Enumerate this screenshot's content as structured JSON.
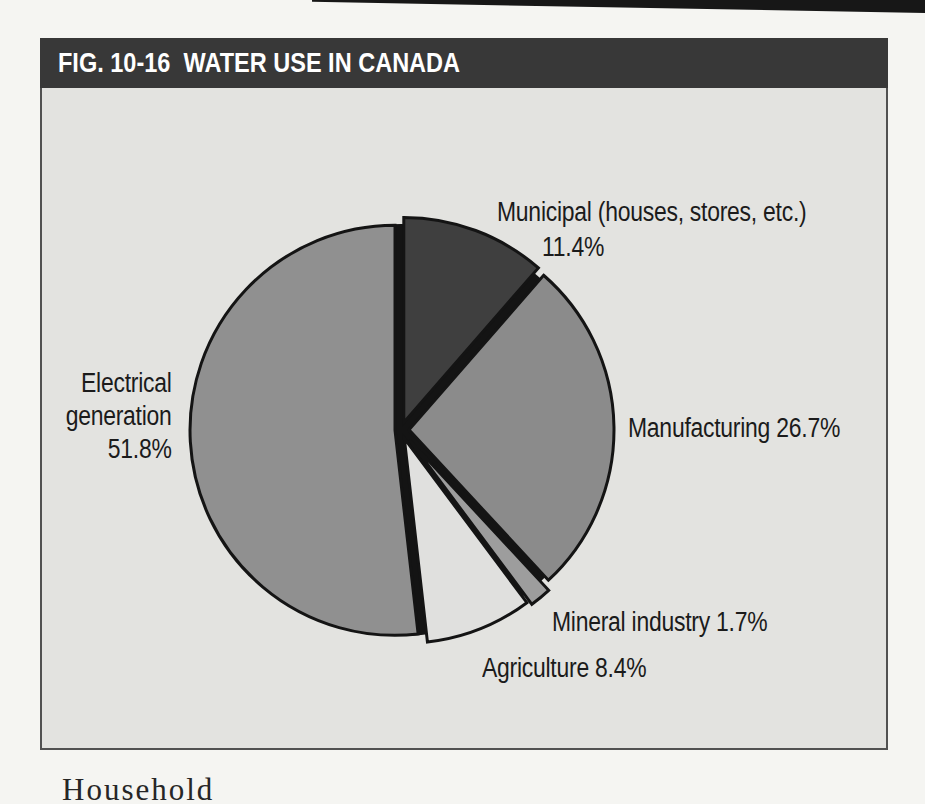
{
  "figure": {
    "title": "FIG. 10-16  WATER USE IN CANADA"
  },
  "chart_data": {
    "type": "pie",
    "title": "FIG. 10-16 WATER USE IN CANADA",
    "unit": "percent",
    "start_angle_deg_cw_from_top": 0,
    "direction": "clockwise",
    "gap_color": "#141414",
    "outline_color": "#141414",
    "slices": [
      {
        "label": "Municipal (houses, stores, etc.)",
        "value": 11.4,
        "color": "#3f3f3f",
        "explode_px": 8
      },
      {
        "label": "Manufacturing",
        "value": 26.7,
        "color": "#8b8b8b",
        "explode_px": 8
      },
      {
        "label": "Mineral industry",
        "value": 1.7,
        "color": "#9d9d9d",
        "explode_px": 13
      },
      {
        "label": "Agriculture",
        "value": 8.4,
        "color": "#e0e0de",
        "explode_px": 9
      },
      {
        "label": "Electrical generation",
        "value": 51.8,
        "color": "#909090",
        "explode_px": 6
      }
    ],
    "labels": {
      "municipal_line1": "Municipal (houses, stores, etc.)",
      "municipal_line2": "11.4%",
      "manufacturing": "Manufacturing 26.7%",
      "mineral": "Mineral industry 1.7%",
      "agriculture": "Agriculture 8.4%",
      "electrical_line1": "Electrical",
      "electrical_line2": "generation",
      "electrical_line3": "51.8%"
    }
  },
  "page": {
    "partial_body_text": "Household"
  }
}
